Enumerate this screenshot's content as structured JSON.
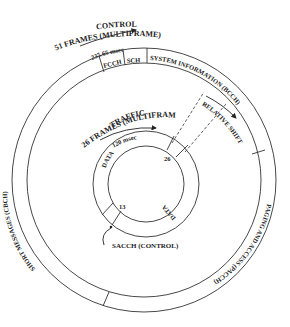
{
  "control": {
    "title": "CONTROL",
    "frames": "51 FRAMES (MULTIFRAME)",
    "duration": "235.65 msec",
    "segments": {
      "fcch": "FCCH",
      "sch": "SCH",
      "system_information": "SYSTEM INFORMATION (BCCH)",
      "paging_access": "PAGING AND ACCESS (PACCH)",
      "short_messages": "SHORT MESSAGES (CBCH)"
    }
  },
  "traffic": {
    "title": "TRAFFIC",
    "frames": "26 FRAMES (MULTIFRAME)",
    "duration": "120 msec",
    "data_upper": "DATA",
    "data_lower": "DATA",
    "slot_26": "26",
    "slot_13": "13",
    "sacch": "SACCH (CONTROL)"
  },
  "relative_shift": "RELATIVE SHIFT",
  "colors": {
    "line": "#333333",
    "text": "#222222",
    "background": "#ffffff"
  }
}
